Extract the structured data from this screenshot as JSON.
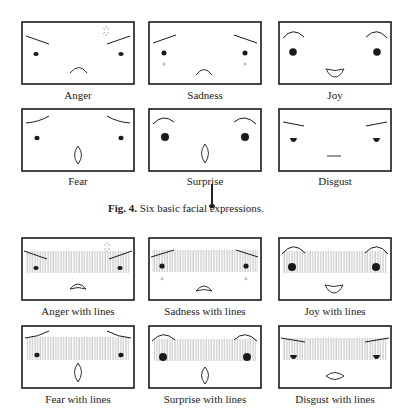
{
  "figure": {
    "caption_prefix": "Fig. 4.",
    "caption_text": " Six basic facial expressions."
  },
  "basic": [
    {
      "label": "Anger"
    },
    {
      "label": "Sadness"
    },
    {
      "label": "Joy"
    },
    {
      "label": "Fear"
    },
    {
      "label": "Surprise"
    },
    {
      "label": "Disgust"
    }
  ],
  "with_lines": [
    {
      "label": "Anger with lines"
    },
    {
      "label": "Sadness with lines"
    },
    {
      "label": "Joy with lines"
    },
    {
      "label": "Fear with lines"
    },
    {
      "label": "Surprise with lines"
    },
    {
      "label": "Disgust with lines"
    }
  ],
  "colors": {
    "stroke": "#1a1a1a",
    "hatch": "#9a9a9a",
    "tear": "#bbbbbb",
    "background": "#ffffff"
  }
}
